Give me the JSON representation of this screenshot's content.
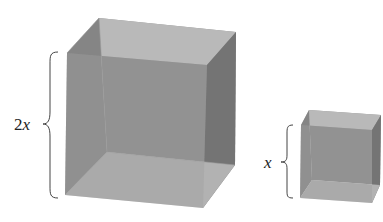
{
  "figure": {
    "large_cube": {
      "label_coef": "2",
      "label_var": "x",
      "colors": {
        "top": "#bcbcbc",
        "back": "#8e8e8e",
        "left": "#7e7e7e",
        "right": "#737373",
        "bottom": "#b2b2b2",
        "front": "#9a9a9a"
      }
    },
    "small_cube": {
      "label_var": "x",
      "colors": {
        "top": "#bcbcbc",
        "back": "#8e8e8e",
        "left": "#7e7e7e",
        "right": "#737373",
        "bottom": "#b2b2b2",
        "front": "#9a9a9a"
      }
    }
  }
}
